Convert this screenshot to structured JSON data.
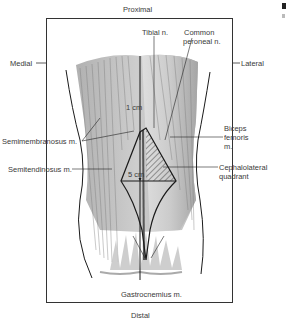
{
  "diagram": {
    "orientation": {
      "top": "Proximal",
      "bottom": "Distal",
      "left": "Medial",
      "right": "Lateral"
    },
    "labels": {
      "tibial_nerve": "Tibial n.",
      "common_peroneal_1": "Common",
      "common_peroneal_2": "peroneal n.",
      "semimembranosus": "Semimembranosus m.",
      "semitendinosus": "Semitendinosus m.",
      "biceps_1": "Biceps",
      "biceps_2": "femoris",
      "biceps_3": "m.",
      "cephalolateral_1": "Cephalolateral",
      "cephalolateral_2": "quadrant",
      "gastrocnemius": "Gastrocnemius m."
    },
    "measurements": {
      "top_offset": "1 cm",
      "width": "5 cm"
    },
    "colors": {
      "muscle_dark": "#9a9a9a",
      "muscle_light": "#d6d6d6",
      "outline": "#1a1a1a",
      "hatch": "#444444"
    }
  }
}
